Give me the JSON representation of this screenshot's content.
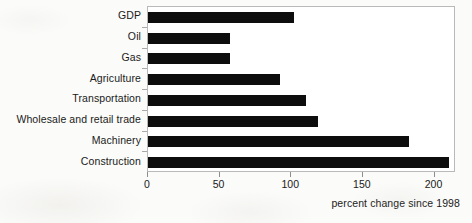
{
  "chart_data": {
    "type": "bar",
    "orientation": "horizontal",
    "title": "",
    "xlabel": "percent change since 1998",
    "ylabel": "",
    "categories": [
      "GDP",
      "Oil",
      "Gas",
      "Agriculture",
      "Transportation",
      "Wholesale and retail trade",
      "Machinery",
      "Construction"
    ],
    "values": [
      102,
      57,
      57,
      92,
      110,
      119,
      182,
      210
    ],
    "xlim": [
      0,
      215
    ],
    "xticks": [
      0,
      50,
      100,
      150,
      200
    ],
    "xtick_labels": [
      "0",
      "50",
      "100",
      "150",
      "200"
    ],
    "grid": false,
    "legend": false,
    "bar_color": "#0d0d0d",
    "plot_background": "#ffffff",
    "frame_color": "#b9b9b9"
  },
  "caption": {
    "text": "percent change since 1998"
  }
}
